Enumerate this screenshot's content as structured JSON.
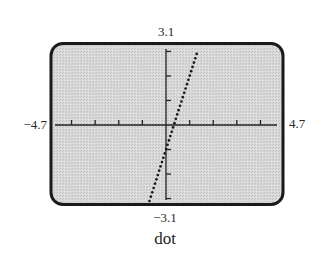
{
  "window": {
    "ymax_label": "3.1",
    "ymin_label": "−3.1",
    "xmin_label": "−4.7",
    "xmax_label": "4.7"
  },
  "caption": "dot",
  "colors": {
    "frame": "#1a1a1a",
    "screen_bg": "#d6d6d6",
    "axes": "#222222",
    "plot": "#1a1a1a"
  },
  "chart_data": {
    "type": "scatter",
    "title": "",
    "caption": "dot",
    "mode": "dot",
    "xlabel": "",
    "ylabel": "",
    "xlim": [
      -4.7,
      4.7
    ],
    "ylim": [
      -3.1,
      3.1
    ],
    "xscale": 1,
    "yscale": 1,
    "x_ticks": [
      -4,
      -3,
      -2,
      -1,
      1,
      2,
      3,
      4
    ],
    "y_ticks": [
      -3,
      -2,
      -1,
      1,
      2,
      3
    ],
    "x_tick_labels": [
      "−4.7",
      "4.7"
    ],
    "y_tick_labels": [
      "−3.1",
      "3.1"
    ],
    "grid": false,
    "legend": null,
    "series": [
      {
        "name": "y = 3x - 1 (dot mode)",
        "equation": "y = 3x - 1",
        "style": "dotted",
        "x": [
          -0.7,
          -0.6,
          -0.5,
          -0.4,
          -0.3,
          -0.2,
          -0.1,
          0.0,
          0.1,
          0.2,
          0.3,
          0.4,
          0.5,
          0.6,
          0.7,
          0.8,
          0.9,
          1.0,
          1.1,
          1.2,
          1.3
        ],
        "y": [
          -3.1,
          -2.8,
          -2.5,
          -2.2,
          -1.9,
          -1.6,
          -1.3,
          -1.0,
          -0.7,
          -0.4,
          -0.1,
          0.2,
          0.5,
          0.8,
          1.1,
          1.4,
          1.7,
          2.0,
          2.3,
          2.6,
          2.9
        ]
      }
    ]
  }
}
